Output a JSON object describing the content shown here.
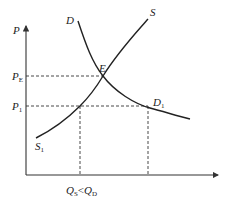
{
  "diagram": {
    "type": "supply-demand",
    "axes": {
      "y_label": "P",
      "x_label": ""
    },
    "curves": {
      "demand": {
        "label": "D",
        "end_label_main": "D",
        "end_label_sub": "1"
      },
      "supply": {
        "label": "S",
        "start_label_main": "S",
        "start_label_sub": "1"
      }
    },
    "points": {
      "equilibrium": "E"
    },
    "price_levels": {
      "pe": {
        "main": "P",
        "sub": "E"
      },
      "p1": {
        "main": "P",
        "sub": "1"
      }
    },
    "quantity_annotation": {
      "qs_main": "Q",
      "qs_sub": "S",
      "relation": "<",
      "qd_main": "Q",
      "qd_sub": "D"
    },
    "colors": {
      "line": "#222222",
      "background": "#ffffff"
    }
  }
}
